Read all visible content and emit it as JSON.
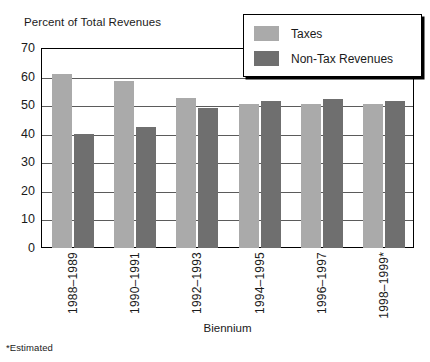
{
  "chart_data": {
    "type": "bar",
    "title": "",
    "ylabel": "Percent of Total Revenues",
    "xlabel": "Biennium",
    "ylim": [
      0,
      70
    ],
    "ytick_step": 10,
    "yticks": [
      70,
      60,
      50,
      40,
      30,
      20,
      10,
      0
    ],
    "grid": true,
    "legend_position": "top-right",
    "categories": [
      "1988–1989",
      "1990–1991",
      "1992–1993",
      "1994–1995",
      "1996–1997",
      "1998–1999*"
    ],
    "series": [
      {
        "name": "Taxes",
        "color": "#aaaaaa",
        "values": [
          61,
          58.5,
          52.5,
          50.5,
          50.5,
          50.5
        ]
      },
      {
        "name": "Non-Tax Revenues",
        "color": "#6f6f6f",
        "values": [
          40,
          42.5,
          49,
          51.5,
          52,
          51.5
        ]
      }
    ],
    "footnote": "*Estimated"
  },
  "legend": {
    "items": [
      {
        "label": "Taxes",
        "swatch": "taxes"
      },
      {
        "label": "Non-Tax Revenues",
        "swatch": "nontax"
      }
    ]
  }
}
